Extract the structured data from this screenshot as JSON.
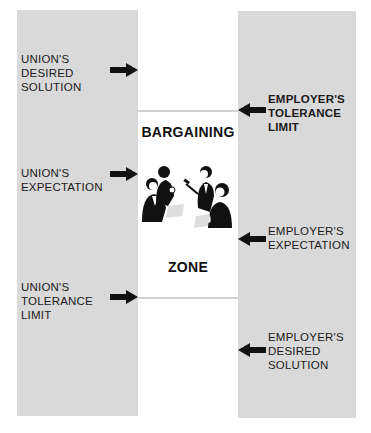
{
  "diagram": {
    "center": {
      "title_top": "BARGAINING",
      "title_bottom": "ZONE",
      "illustration": "negotiators-meeting-illustration"
    },
    "union": {
      "desired_solution": "UNION'S\nDESIRED\nSOLUTION",
      "expectation": "UNION'S\nEXPECTATION",
      "tolerance_limit": "UNION'S\nTOLERANCE\nLIMIT"
    },
    "employer": {
      "tolerance_limit": "EMPLOYER'S\nTOLERANCE\nLIMIT",
      "expectation": "EMPLOYER'S\nEXPECTATION",
      "desired_solution": "EMPLOYER'S\nDESIRED\nSOLUTION"
    },
    "colors": {
      "column_fill": "#d9d9d9",
      "arrow": "#111111",
      "zone_line": "#d2d2d2"
    }
  }
}
